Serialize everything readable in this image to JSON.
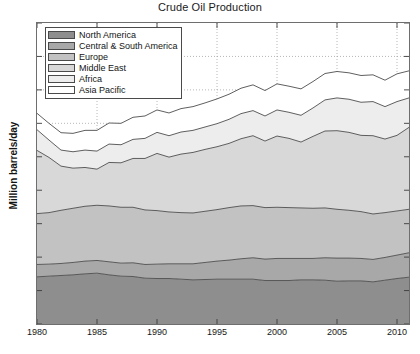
{
  "chart": {
    "title": "Crude Oil Production",
    "ylabel": "Million barrels/day",
    "xlabel": ""
  },
  "axes": {
    "yticks": [
      "0",
      "10",
      "20",
      "30",
      "40",
      "50",
      "60",
      "70",
      "80",
      "90"
    ],
    "xticks": [
      "1980",
      "1985",
      "1990",
      "1995",
      "2000",
      "2005",
      "2010"
    ]
  },
  "legend": {
    "items": [
      {
        "label": "North America",
        "color": "#8e8e8e"
      },
      {
        "label": "Central & South America",
        "color": "#a8a8a8"
      },
      {
        "label": "Europe",
        "color": "#c2c2c2"
      },
      {
        "label": "Middle East",
        "color": "#d8d8d8"
      },
      {
        "label": "Africa",
        "color": "#ededed"
      },
      {
        "label": "Asia Pacific",
        "color": "#ffffff"
      }
    ]
  },
  "chart_data": {
    "type": "area",
    "stacked": true,
    "title": "Crude Oil Production",
    "xlabel": "",
    "ylabel": "Million barrels/day",
    "xlim": [
      1980,
      2011
    ],
    "ylim": [
      0,
      90
    ],
    "grid": true,
    "grid_style": "dotted",
    "legend_position": "upper-left",
    "x": [
      1980,
      1981,
      1982,
      1983,
      1984,
      1985,
      1986,
      1987,
      1988,
      1989,
      1990,
      1991,
      1992,
      1993,
      1994,
      1995,
      1996,
      1997,
      1998,
      1999,
      2000,
      2001,
      2002,
      2003,
      2004,
      2005,
      2006,
      2007,
      2008,
      2009,
      2010,
      2011
    ],
    "series": [
      {
        "name": "North America",
        "color": "#8e8e8e",
        "values": [
          14.1,
          14.3,
          14.5,
          14.7,
          15.0,
          15.2,
          14.7,
          14.3,
          14.2,
          13.7,
          13.6,
          13.6,
          13.4,
          13.2,
          13.3,
          13.4,
          13.4,
          13.4,
          13.4,
          13.0,
          13.0,
          13.0,
          13.2,
          13.2,
          13.1,
          12.8,
          12.9,
          12.9,
          12.6,
          13.1,
          13.6,
          14.0
        ]
      },
      {
        "name": "Central & South America",
        "color": "#a8a8a8",
        "values": [
          3.7,
          3.6,
          3.6,
          3.7,
          3.8,
          3.8,
          3.9,
          3.9,
          4.1,
          4.1,
          4.3,
          4.4,
          4.6,
          4.8,
          5.1,
          5.4,
          5.7,
          6.1,
          6.4,
          6.4,
          6.6,
          6.6,
          6.4,
          6.4,
          6.7,
          6.9,
          6.8,
          6.7,
          6.7,
          6.8,
          7.0,
          7.3
        ]
      },
      {
        "name": "Europe",
        "color": "#c2c2c2",
        "values": [
          15.2,
          15.4,
          15.9,
          16.2,
          16.4,
          16.5,
          16.7,
          16.7,
          16.6,
          16.3,
          16.0,
          15.5,
          15.3,
          15.2,
          15.3,
          15.4,
          15.7,
          15.8,
          15.6,
          15.4,
          15.3,
          15.2,
          15.1,
          15.0,
          14.9,
          14.6,
          14.3,
          14.0,
          13.6,
          13.4,
          13.2,
          13.0
        ]
      },
      {
        "name": "Middle East",
        "color": "#d8d8d8",
        "values": [
          18.9,
          16.5,
          13.2,
          12.0,
          11.6,
          10.8,
          13.0,
          13.3,
          14.6,
          15.4,
          17.1,
          16.4,
          17.5,
          18.1,
          18.5,
          18.8,
          19.2,
          20.1,
          20.9,
          19.9,
          21.3,
          20.7,
          19.7,
          21.5,
          23.0,
          23.5,
          23.3,
          22.8,
          23.4,
          22.0,
          22.6,
          24.5
        ]
      },
      {
        "name": "Africa",
        "color": "#ededed",
        "values": [
          6.2,
          5.2,
          4.8,
          4.9,
          5.2,
          5.4,
          5.5,
          5.4,
          5.7,
          6.0,
          6.3,
          6.4,
          6.6,
          6.6,
          6.7,
          6.9,
          7.2,
          7.5,
          7.5,
          7.5,
          7.8,
          7.8,
          8.0,
          8.5,
          9.3,
          9.8,
          9.9,
          9.9,
          10.2,
          9.7,
          10.1,
          8.8
        ]
      },
      {
        "name": "Asia Pacific",
        "color": "#ffffff",
        "values": [
          4.9,
          5.0,
          5.2,
          5.5,
          5.9,
          6.2,
          6.3,
          6.4,
          6.6,
          6.7,
          6.7,
          6.8,
          7.0,
          7.1,
          7.2,
          7.4,
          7.5,
          7.6,
          7.7,
          7.6,
          7.8,
          7.8,
          7.9,
          7.9,
          7.9,
          7.9,
          7.9,
          8.0,
          8.0,
          7.9,
          8.3,
          8.1
        ]
      }
    ],
    "totals": [
      63.0,
      60.0,
      57.2,
      57.0,
      57.9,
      57.9,
      60.1,
      60.0,
      61.8,
      62.2,
      64.0,
      63.1,
      64.4,
      65.0,
      66.1,
      67.3,
      68.7,
      70.5,
      71.5,
      69.8,
      71.8,
      71.1,
      70.3,
      72.5,
      74.9,
      75.5,
      75.1,
      74.3,
      74.5,
      72.9,
      74.8,
      75.7
    ]
  }
}
